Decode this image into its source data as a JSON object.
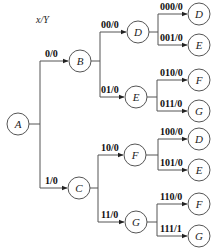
{
  "title": "x/Y",
  "root": "A",
  "nodes": {
    "A": "A",
    "B": "B",
    "C": "C",
    "D1": "D",
    "E1": "E",
    "F1": "F",
    "G1": "G",
    "D2": "D",
    "E2": "E",
    "F2": "F",
    "G2": "G",
    "D3": "D",
    "E3": "E",
    "F3": "F",
    "G3": "G"
  },
  "edges": {
    "A_B": "0/0",
    "A_C": "1/0",
    "B_D1": "00/0",
    "B_E1": "01/0",
    "C_F1": "10/0",
    "C_G1": "11/0",
    "D1_D2": "000/0",
    "D1_E2": "001/0",
    "E1_F2": "010/0",
    "E1_G2": "011/0",
    "F1_D3": "100/0",
    "F1_E3": "101/0",
    "G1_F3": "110/0",
    "G1_G3": "111/1"
  }
}
